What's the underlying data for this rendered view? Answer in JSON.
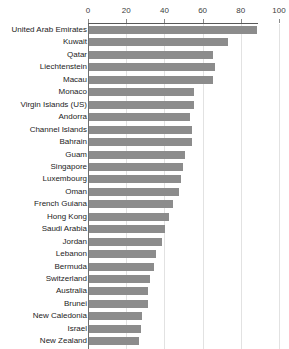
{
  "chart_data": {
    "type": "bar",
    "orientation": "horizontal",
    "title": "",
    "xlabel": "",
    "ylabel": "",
    "xlim": [
      0,
      100
    ],
    "ticks": [
      0,
      20,
      40,
      60,
      80,
      100
    ],
    "grid": true,
    "legend": false,
    "bar_color": "#8c8c8c",
    "categories": [
      "United Arab Emirates",
      "Kuwait",
      "Qatar",
      "Liechtenstein",
      "Macau",
      "Monaco",
      "Virgin Islands (US)",
      "Andorra",
      "Channel Islands",
      "Bahrain",
      "Guam",
      "Singapore",
      "Luxembourg",
      "Oman",
      "French Guiana",
      "Hong Kong",
      "Saudi Arabia",
      "Jordan",
      "Lebanon",
      "Bermuda",
      "Switzerland",
      "Australia",
      "Brunei",
      "New Caledonia",
      "Israel",
      "New Zealand"
    ],
    "values": [
      88,
      73,
      65,
      66,
      65,
      55,
      55,
      53,
      54,
      54,
      50,
      49,
      48,
      47,
      44,
      42,
      40,
      38,
      35,
      34,
      32,
      31,
      31,
      28,
      27,
      26
    ]
  }
}
